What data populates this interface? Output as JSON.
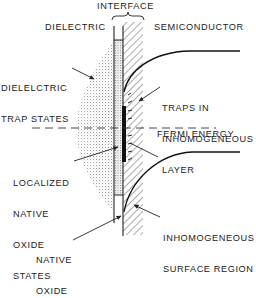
{
  "diagram": {
    "type": "semiconductor-interface-band-diagram",
    "colors": {
      "ink": "#222222",
      "stipple": "#9a9a9a",
      "background": "#ffffff"
    },
    "regions": {
      "dielectric": "DIELECTRIC",
      "interface": "INTERFACE",
      "semiconductor": "SEMICONDUCTOR"
    },
    "labels": {
      "dielectric_trap_states": [
        "DIELELCTRIC",
        "TRAP STATES"
      ],
      "traps_in_inhomogeneous_layer": [
        "TRAPS IN",
        "INHOMOGENEOUS",
        "LAYER"
      ],
      "fermi_energy": "FERMI ENERGY",
      "localized_native_oxide_states": [
        "LOCALIZED",
        "NATIVE",
        "OXIDE",
        "STATES"
      ],
      "inhomogeneous_surface_region": [
        "INHOMOGENEOUS",
        "SURFACE REGION"
      ],
      "native_oxide": [
        "NATIVE",
        "OXIDE"
      ]
    }
  }
}
